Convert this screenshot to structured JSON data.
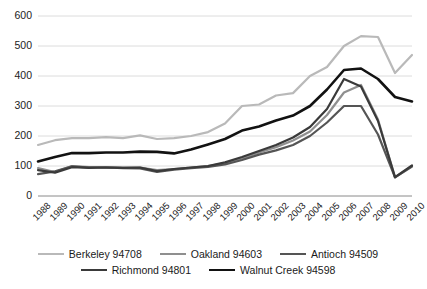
{
  "chart_data": {
    "type": "line",
    "title": "",
    "xlabel": "",
    "ylabel": "",
    "ylim": [
      0,
      600
    ],
    "ytick_values": [
      0,
      100,
      200,
      300,
      400,
      500,
      600
    ],
    "ytick_labels": [
      "0",
      "100",
      "200",
      "300",
      "400",
      "500",
      "600"
    ],
    "grid": true,
    "legend_position": "bottom",
    "categories": [
      "1988",
      "1989",
      "1990",
      "1991",
      "1992",
      "1993",
      "1994",
      "1995",
      "1996",
      "1997",
      "1998",
      "1999",
      "2000",
      "2001",
      "2002",
      "2003",
      "2004",
      "2005",
      "2006",
      "2007",
      "2008",
      "2009",
      "2010"
    ],
    "series": [
      {
        "name": "Berkeley 94708",
        "color": "#b9b9b9",
        "width": 2.2,
        "values": [
          170,
          186,
          193,
          193,
          196,
          193,
          202,
          190,
          193,
          200,
          213,
          242,
          300,
          305,
          335,
          343,
          400,
          430,
          500,
          533,
          530,
          410,
          470
        ]
      },
      {
        "name": "Oakland 94603",
        "color": "#8f8f8f",
        "width": 2.2,
        "values": [
          93,
          80,
          100,
          96,
          96,
          95,
          95,
          86,
          90,
          95,
          100,
          110,
          125,
          145,
          163,
          185,
          215,
          270,
          345,
          370,
          255,
          62,
          100
        ]
      },
      {
        "name": "Antioch 94509",
        "color": "#555555",
        "width": 2.2,
        "values": [
          73,
          82,
          99,
          95,
          95,
          93,
          92,
          80,
          88,
          93,
          97,
          105,
          120,
          138,
          152,
          170,
          200,
          245,
          300,
          300,
          205,
          62,
          98
        ]
      },
      {
        "name": "Richmond 94801",
        "color": "#3a3a3a",
        "width": 2.2,
        "values": [
          86,
          78,
          96,
          94,
          95,
          94,
          95,
          83,
          90,
          95,
          100,
          112,
          130,
          150,
          170,
          195,
          230,
          290,
          390,
          365,
          250,
          63,
          102
        ]
      },
      {
        "name": "Walnut Creek 94598",
        "color": "#121212",
        "width": 2.6,
        "values": [
          115,
          130,
          143,
          143,
          145,
          145,
          148,
          147,
          142,
          155,
          172,
          190,
          218,
          232,
          252,
          268,
          300,
          355,
          420,
          425,
          390,
          330,
          315
        ]
      }
    ]
  }
}
